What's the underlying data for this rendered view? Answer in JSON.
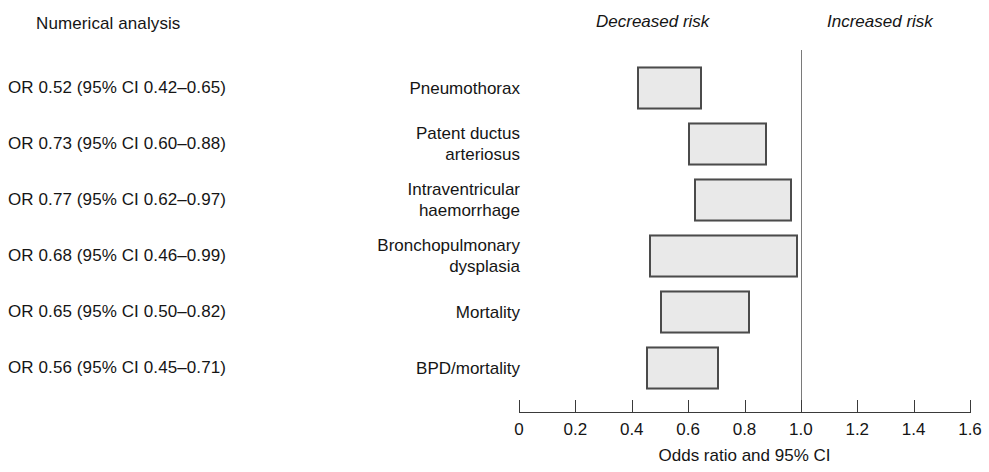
{
  "columns": {
    "numerical_analysis_heading": "Numerical analysis",
    "decreased_risk_label": "Decreased risk",
    "increased_risk_label": "Increased risk"
  },
  "axis": {
    "title": "Odds ratio and 95% CI",
    "ticks": [
      "0",
      "0.2",
      "0.4",
      "0.6",
      "0.8",
      "1.0",
      "1.2",
      "1.4",
      "1.6"
    ],
    "tick_values": [
      0,
      0.2,
      0.4,
      0.6,
      0.8,
      1.0,
      1.2,
      1.4,
      1.6
    ],
    "min": 0,
    "max": 1.6,
    "reference_value": 1.0
  },
  "style": {
    "bar_fill": "#e9e9e9",
    "bar_border": "#4b4b4b",
    "axis_color": "#3a3a3a",
    "reference_line_color": "#7a7a7a",
    "text_color": "#151515"
  },
  "chart_data": {
    "type": "bar",
    "title": "",
    "xlabel": "Odds ratio and 95% CI",
    "ylabel": "",
    "xlim": [
      0,
      1.6
    ],
    "grid": false,
    "legend": "none",
    "annotations": [
      "Decreased risk",
      "Increased risk"
    ],
    "reference_line": 1.0,
    "categories": [
      "Pneumothorax",
      "Patent ductus arteriosus",
      "Intraventricular haemorrhage",
      "Bronchopulmonary dysplasia",
      "Mortality",
      "BPD/mortality"
    ],
    "values": [
      0.52,
      0.73,
      0.77,
      0.68,
      0.65,
      0.56
    ],
    "ci_low": [
      0.42,
      0.6,
      0.62,
      0.46,
      0.5,
      0.45
    ],
    "ci_high": [
      0.65,
      0.88,
      0.97,
      0.99,
      0.82,
      0.71
    ]
  },
  "rows": [
    {
      "or_text": "OR 0.52 (95% CI 0.42–0.65)",
      "outcome_lines": [
        "Pneumothorax"
      ],
      "or": 0.52,
      "low": 0.42,
      "high": 0.65
    },
    {
      "or_text": "OR 0.73 (95% CI 0.60–0.88)",
      "outcome_lines": [
        "Patent ductus",
        "arteriosus"
      ],
      "or": 0.73,
      "low": 0.6,
      "high": 0.88
    },
    {
      "or_text": "OR 0.77 (95% CI 0.62–0.97)",
      "outcome_lines": [
        "Intraventricular",
        "haemorrhage"
      ],
      "or": 0.77,
      "low": 0.62,
      "high": 0.97
    },
    {
      "or_text": "OR 0.68 (95% CI 0.46–0.99)",
      "outcome_lines": [
        "Bronchopulmonary",
        "dysplasia"
      ],
      "or": 0.68,
      "low": 0.46,
      "high": 0.99
    },
    {
      "or_text": "OR 0.65 (95% CI 0.50–0.82)",
      "outcome_lines": [
        "Mortality"
      ],
      "or": 0.65,
      "low": 0.5,
      "high": 0.82
    },
    {
      "or_text": "OR 0.56 (95% CI 0.45–0.71)",
      "outcome_lines": [
        "BPD/mortality"
      ],
      "or": 0.56,
      "low": 0.45,
      "high": 0.71
    }
  ]
}
